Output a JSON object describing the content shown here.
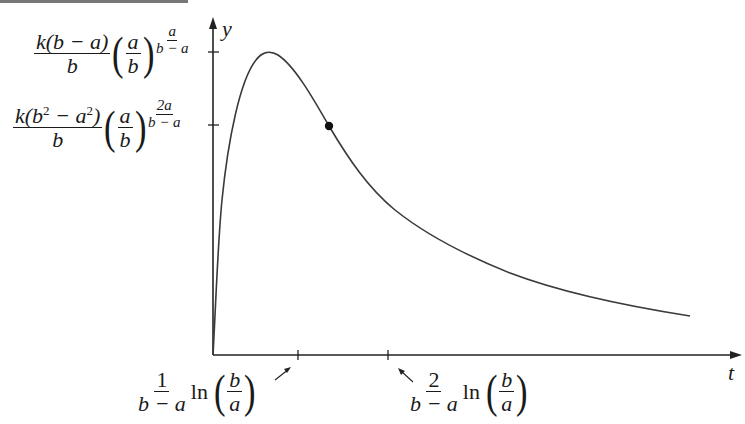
{
  "axes": {
    "x_label": "t",
    "y_label": "y"
  },
  "y_ticks": [
    {
      "id": "max",
      "coef_num": "k(b − a)",
      "coef_den": "b",
      "base_num": "a",
      "base_den": "b",
      "exp_num": "a",
      "exp_den": "b − a"
    },
    {
      "id": "inflection",
      "coef_num_prefix": "k(b",
      "coef_num_sq1": "2",
      "coef_num_mid": " − a",
      "coef_num_sq2": "2",
      "coef_num_suffix": ")",
      "coef_den": "b",
      "base_num": "a",
      "base_den": "b",
      "exp_num": "2a",
      "exp_den": "b − a"
    }
  ],
  "x_ticks": [
    {
      "id": "t_max",
      "coef_num": "1",
      "coef_den": "b − a",
      "fn": "ln",
      "arg_num": "b",
      "arg_den": "a"
    },
    {
      "id": "t_inflection",
      "coef_num": "2",
      "coef_den": "b − a",
      "fn": "ln",
      "arg_num": "b",
      "arg_den": "a"
    }
  ],
  "curve": {
    "description": "Rises steeply from origin to a maximum, then decays with an inflection point (marked by a dot)",
    "color": "#3a3a3a",
    "marker": "inflection-point-dot"
  }
}
